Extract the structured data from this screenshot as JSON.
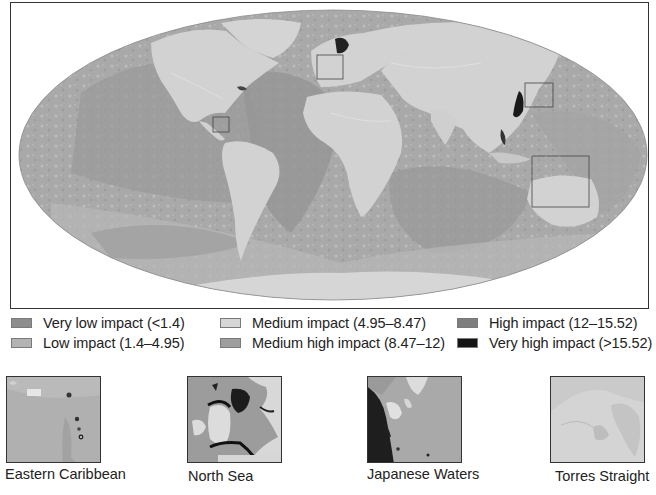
{
  "map": {
    "projection": "mollweide",
    "land_color": "#d2d2d2",
    "frame_color": "#333333",
    "highlight_boxes": [
      {
        "name": "Eastern Caribbean",
        "x": 212,
        "y": 116,
        "w": 16,
        "h": 15
      },
      {
        "name": "North Sea",
        "x": 316,
        "y": 54,
        "w": 26,
        "h": 24
      },
      {
        "name": "Japanese Waters",
        "x": 524,
        "y": 82,
        "w": 28,
        "h": 24
      },
      {
        "name": "Torres Straight",
        "x": 531,
        "y": 155,
        "w": 57,
        "h": 51
      }
    ]
  },
  "legend": {
    "items": [
      {
        "label": "Very low impact (<1.4)",
        "color": "#8d8d8d"
      },
      {
        "label": "Low impact (1.4–4.95)",
        "color": "#b3b3b3"
      },
      {
        "label": "Medium impact (4.95–8.47)",
        "color": "#d6d6d6"
      },
      {
        "label": "Medium high impact (8.47–12)",
        "color": "#9e9e9e"
      },
      {
        "label": "High impact (12–15.52)",
        "color": "#7e7e7e"
      },
      {
        "label": "Very high impact (>15.52)",
        "color": "#141414"
      }
    ]
  },
  "insets": [
    {
      "caption": "Eastern Caribbean"
    },
    {
      "caption": "North Sea"
    },
    {
      "caption": "Japanese Waters"
    },
    {
      "caption": "Torres Straight"
    }
  ]
}
